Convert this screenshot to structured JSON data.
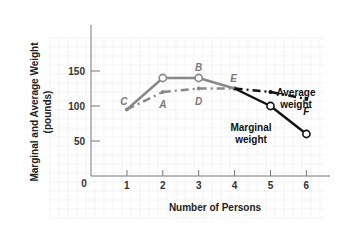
{
  "chart_data": {
    "type": "line",
    "title": "",
    "xlabel": "Number of Persons",
    "ylabel": "Marginal and Average Weight",
    "ylabel_units": "(pounds)",
    "x": [
      1,
      2,
      3,
      4,
      5,
      6
    ],
    "x_ticks": [
      "0",
      "1",
      "2",
      "3",
      "4",
      "5",
      "6"
    ],
    "y_ticks": [
      "0",
      "50",
      "100",
      "150"
    ],
    "xlim": [
      0,
      6.8
    ],
    "ylim": [
      0,
      200
    ],
    "grid": true,
    "series": [
      {
        "name": "Marginal weight",
        "label_lines": [
          "Marginal",
          "weight"
        ],
        "style": "solid",
        "values": [
          95,
          140,
          140,
          125,
          100,
          60
        ]
      },
      {
        "name": "Average weight",
        "label_lines": [
          "Average",
          "weight"
        ],
        "style": "dash-dot",
        "values": [
          95,
          120,
          125,
          125,
          120,
          110
        ]
      }
    ],
    "point_labels": [
      {
        "label": "C",
        "x": 1,
        "y": 95
      },
      {
        "label": "A",
        "x": 2,
        "y": 120
      },
      {
        "label": "B",
        "x": 3,
        "y": 140
      },
      {
        "label": "D",
        "x": 3,
        "y": 125
      },
      {
        "label": "E",
        "x": 4,
        "y": 125
      },
      {
        "label": "F",
        "x": 6,
        "y": 110
      }
    ],
    "colors": {
      "early_segment": "#888888",
      "late_segment": "#111111",
      "grid": "#ececec",
      "axis": "#777777"
    }
  }
}
